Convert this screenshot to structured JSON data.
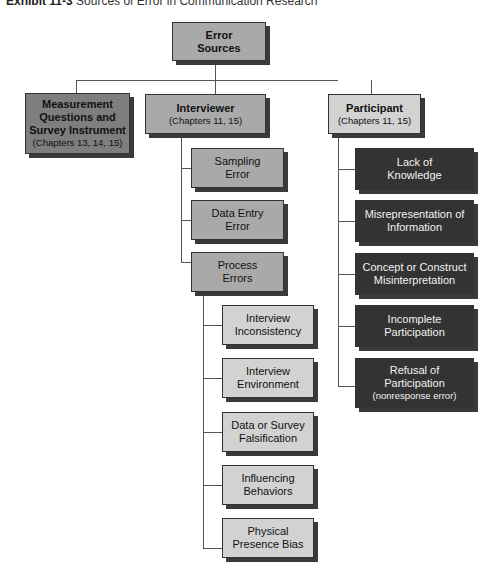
{
  "title": {
    "label": "Exhibit 11-3",
    "text": "Sources of Error in Communication Research"
  },
  "root": {
    "label": "Error Sources"
  },
  "branches": [
    {
      "label": "Measurement Questions and Survey Instrument",
      "sub": "(Chapters 13, 14, 15)"
    },
    {
      "label": "Interviewer",
      "sub": "(Chapters 11, 15)"
    },
    {
      "label": "Participant",
      "sub": "(Chapters 11, 15)"
    }
  ],
  "interviewer_children": [
    {
      "label": "Sampling Error"
    },
    {
      "label": "Data Entry Error"
    },
    {
      "label": "Process Errors"
    }
  ],
  "process_children": [
    {
      "label": "Interview Inconsistency"
    },
    {
      "label": "Interview Environment"
    },
    {
      "label": "Data or Survey Falsification"
    },
    {
      "label": "Influencing Behaviors"
    },
    {
      "label": "Physical Presence Bias"
    }
  ],
  "participant_children": [
    {
      "label": "Lack of Knowledge"
    },
    {
      "label": "Misrepresentation of Information"
    },
    {
      "label": "Concept or Construct Misinterpretation"
    },
    {
      "label": "Incomplete Participation"
    },
    {
      "label": "Refusal of Participation",
      "sub": "(nonresponse error)"
    }
  ]
}
